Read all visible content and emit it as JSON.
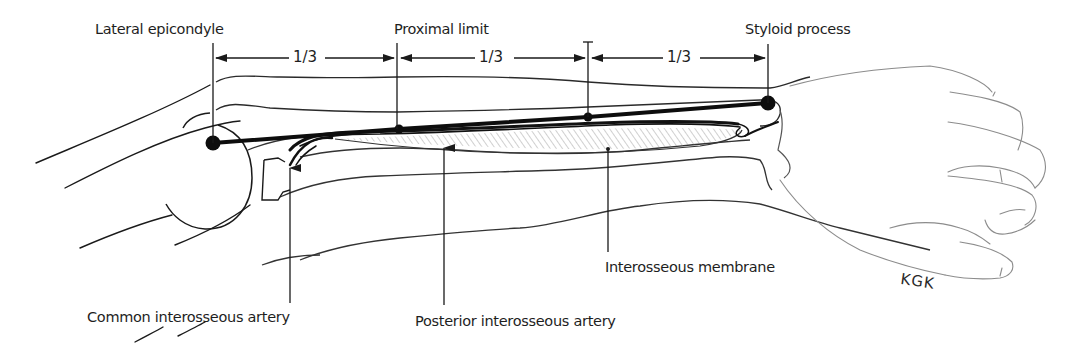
{
  "diagram": {
    "labels": {
      "lateral_epicondyle": "Lateral epicondyle",
      "proximal_limit": "Proximal limit",
      "styloid_process": "Styloid process",
      "interosseous_membrane": "Interosseous membrane",
      "common_interosseous_artery": "Common interosseous artery",
      "posterior_interosseous_artery": "Posterior interosseous artery"
    },
    "segments": [
      {
        "label": "1/3",
        "from": "Lateral epicondyle",
        "to": "Proximal limit"
      },
      {
        "label": "1/3",
        "from": "Proximal limit",
        "to": "Midpoint"
      },
      {
        "label": "1/3",
        "from": "Midpoint",
        "to": "Styloid process"
      }
    ],
    "signature": "KGK",
    "colors": {
      "ink": "#1a1a1a",
      "sketch": "#555555",
      "light_sketch": "#9a9a9a",
      "background": "#ffffff"
    }
  }
}
